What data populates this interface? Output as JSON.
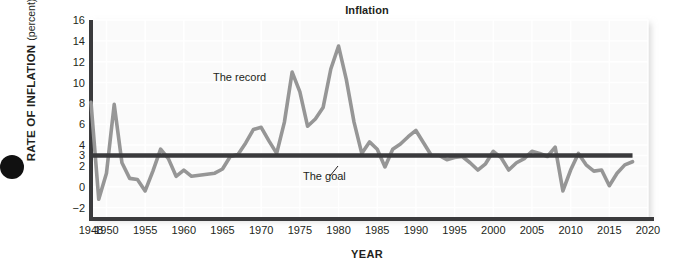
{
  "figure": {
    "title": "Inflation",
    "bullet_icon": "bullet-dot-icon"
  },
  "axes": {
    "y_title_main": "RATE OF INFLATION",
    "y_title_sub": "(percent)",
    "x_title": "YEAR"
  },
  "annotations": {
    "record_label": "The record",
    "goal_label": "The goal"
  },
  "chart_data": {
    "type": "line",
    "title": "Inflation",
    "xlabel": "YEAR",
    "ylabel": "RATE OF INFLATION (percent)",
    "xlim": [
      1948,
      2020
    ],
    "ylim": [
      -3,
      16
    ],
    "grid": true,
    "legend_position": "inline-annotations",
    "y_ticks": [
      -2,
      0,
      2,
      3,
      4,
      6,
      8,
      10,
      12,
      14,
      16
    ],
    "y_tick_labels": [
      "−2",
      "0",
      "2",
      "3",
      "4",
      "6",
      "8",
      "10",
      "12",
      "14",
      "16"
    ],
    "x_ticks": [
      1948,
      1950,
      1955,
      1960,
      1965,
      1970,
      1975,
      1980,
      1985,
      1990,
      1995,
      2000,
      2005,
      2010,
      2015,
      2020
    ],
    "x_tick_labels": [
      "1948",
      "1950",
      "1955",
      "1960",
      "1965",
      "1970",
      "1975",
      "1980",
      "1985",
      "1990",
      "1995",
      "2000",
      "2005",
      "2010",
      "2015",
      "2020"
    ],
    "colors": {
      "record_line": "#969696",
      "goal_line": "#3a3a3c",
      "axis": "#3a3a3c",
      "plot_background": "#fafafa",
      "grid": "#ffffff",
      "text": "#231f20"
    },
    "series": [
      {
        "name": "The record",
        "type": "line",
        "color": "#969696",
        "x": [
          1948,
          1949,
          1950,
          1951,
          1952,
          1953,
          1954,
          1955,
          1956,
          1957,
          1958,
          1959,
          1960,
          1961,
          1962,
          1963,
          1964,
          1965,
          1966,
          1967,
          1968,
          1969,
          1970,
          1971,
          1972,
          1973,
          1974,
          1975,
          1976,
          1977,
          1978,
          1979,
          1980,
          1981,
          1982,
          1983,
          1984,
          1985,
          1986,
          1987,
          1988,
          1989,
          1990,
          1991,
          1992,
          1993,
          1994,
          1995,
          1996,
          1997,
          1998,
          1999,
          2000,
          2001,
          2002,
          2003,
          2004,
          2005,
          2006,
          2007,
          2008,
          2009,
          2010,
          2011,
          2012,
          2013,
          2014,
          2015,
          2016,
          2017,
          2018
        ],
        "y": [
          8.1,
          -1.2,
          1.3,
          7.9,
          2.3,
          0.8,
          0.7,
          -0.4,
          1.5,
          3.6,
          2.7,
          1.0,
          1.6,
          1.0,
          1.1,
          1.2,
          1.3,
          1.7,
          2.9,
          3.1,
          4.2,
          5.5,
          5.7,
          4.4,
          3.2,
          6.2,
          11.0,
          9.1,
          5.8,
          6.5,
          7.6,
          11.3,
          13.5,
          10.3,
          6.2,
          3.2,
          4.3,
          3.6,
          1.9,
          3.6,
          4.1,
          4.8,
          5.4,
          4.2,
          3.0,
          3.0,
          2.6,
          2.8,
          2.9,
          2.3,
          1.6,
          2.2,
          3.4,
          2.8,
          1.6,
          2.3,
          2.7,
          3.4,
          3.2,
          2.9,
          3.8,
          -0.4,
          1.6,
          3.2,
          2.1,
          1.5,
          1.6,
          0.1,
          1.3,
          2.1,
          2.4
        ]
      },
      {
        "name": "The goal",
        "type": "hline",
        "color": "#3a3a3c",
        "value": 3.0,
        "x_start": 1948,
        "x_end": 2018
      }
    ]
  }
}
